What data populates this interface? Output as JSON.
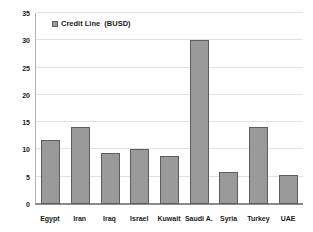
{
  "chart_data": {
    "type": "bar",
    "title": "",
    "xlabel": "",
    "ylabel": "",
    "categories": [
      "Egypt",
      "Iran",
      "Iraq",
      "Israel",
      "Kuwait",
      "Saudi A.",
      "Syria",
      "Turkey",
      "UAE"
    ],
    "values": [
      11.8,
      14.2,
      9.3,
      10.0,
      8.8,
      30.0,
      5.8,
      14.2,
      5.4
    ],
    "series": [
      {
        "name": "Credit Line  (BUSD)",
        "values": [
          11.8,
          14.2,
          9.3,
          10.0,
          8.8,
          30.0,
          5.8,
          14.2,
          5.4
        ]
      }
    ],
    "ylim": [
      0,
      35
    ],
    "ytick_values": [
      0,
      5,
      10,
      15,
      20,
      25,
      30,
      35
    ],
    "ytick_labels": [
      "0",
      "5",
      "10",
      "15",
      "20",
      "25",
      "30",
      "35"
    ],
    "grid": true,
    "grid_axis": "y",
    "legend": {
      "position": "top-left-inside",
      "entries": [
        {
          "label": "Credit Line  (BUSD)",
          "marker": "legend-swatch",
          "color": "#9a9a9a"
        }
      ]
    },
    "colors": {
      "bar_fill": "#9a9a9a",
      "bar_border": "#5d5d5d",
      "gridline": "#e2e2e2",
      "axis": "#8a8a8a",
      "text": "#1a1a1a",
      "background": "#ffffff"
    }
  }
}
